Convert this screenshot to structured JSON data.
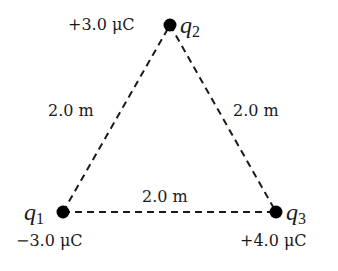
{
  "diagram": {
    "type": "charge-triangle",
    "charges": [
      {
        "id": "q1",
        "symbol": "q",
        "subscript": "1",
        "value": "−3.0 μC",
        "x": 63,
        "y": 212
      },
      {
        "id": "q2",
        "symbol": "q",
        "subscript": "2",
        "value": "+3.0 μC",
        "x": 170,
        "y": 25
      },
      {
        "id": "q3",
        "symbol": "q",
        "subscript": "3",
        "value": "+4.0 μC",
        "x": 276,
        "y": 212
      }
    ],
    "sides": [
      {
        "from": "q1",
        "to": "q2",
        "label": "2.0 m"
      },
      {
        "from": "q2",
        "to": "q3",
        "label": "2.0 m"
      },
      {
        "from": "q1",
        "to": "q3",
        "label": "2.0 m"
      }
    ],
    "colors": {
      "line": "#1a1a1a",
      "dot": "#000000",
      "background": "#ffffff"
    }
  }
}
